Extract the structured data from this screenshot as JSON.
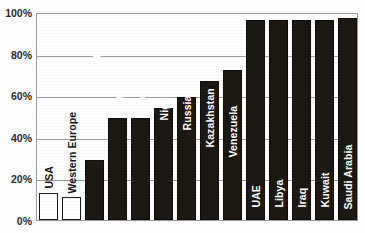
{
  "chart_data": {
    "type": "bar",
    "title": "",
    "xlabel": "",
    "ylabel": "",
    "ylim": [
      0,
      100
    ],
    "y_ticks": [
      "0%",
      "20%",
      "40%",
      "60%",
      "80%",
      "100%"
    ],
    "y_tick_values": [
      0,
      20,
      40,
      60,
      80,
      100
    ],
    "grid": true,
    "legend": false,
    "legend_position": "none",
    "value_unit": "%",
    "categories": [
      "USA",
      "Western Europe",
      "Egypt",
      "Algeria",
      "Iran",
      "Nigeria",
      "Russia",
      "Kazakhstan",
      "Venezuela",
      "UAE",
      "Libya",
      "Iraq",
      "Kuwait",
      "Saudi Arabia"
    ],
    "values": [
      13,
      11,
      29,
      49,
      49,
      54,
      59,
      67,
      72,
      96,
      96,
      96,
      96,
      97
    ],
    "bar_styles": [
      "hollow",
      "hollow",
      "filled",
      "filled",
      "filled",
      "filled",
      "filled",
      "filled",
      "filled",
      "filled",
      "filled",
      "filled",
      "filled",
      "filled"
    ],
    "label_placement": [
      "outside",
      "outside",
      "inside",
      "inside",
      "inside",
      "inside",
      "inside",
      "inside",
      "inside",
      "inside",
      "inside",
      "inside",
      "inside",
      "inside"
    ],
    "colors": {
      "filled_bar": "#1c1711",
      "hollow_bar": "#ffffff",
      "bar_outline": "#0d0a07",
      "gridline": "#9a9a9a",
      "axis_text": "#2b2b2b",
      "inside_label": "#ffffff",
      "outside_label": "#141414",
      "plot_background": "#ffffff",
      "page_background": "#fdfdfd"
    }
  }
}
